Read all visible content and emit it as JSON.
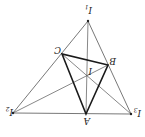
{
  "diagram": {
    "orientation": "rotated 180 degrees",
    "points": {
      "I1": {
        "label": "I",
        "sub": "1",
        "x": 88,
        "y": 21,
        "lx": 84,
        "ly": 10
      },
      "I2": {
        "label": "I",
        "sub": "2",
        "x": 13,
        "y": 113,
        "lx": 4,
        "ly": 106
      },
      "I3": {
        "label": "I",
        "sub": "3",
        "x": 131,
        "y": 114,
        "lx": 132,
        "ly": 107
      },
      "A": {
        "label": "A",
        "x": 86,
        "y": 114,
        "lx": 82,
        "ly": 116
      },
      "B": {
        "label": "B",
        "x": 108,
        "y": 65,
        "lx": 109,
        "ly": 57
      },
      "C": {
        "label": "C",
        "x": 62,
        "y": 54,
        "lx": 53,
        "ly": 46
      },
      "I": {
        "label": "I",
        "x": 87,
        "y": 76,
        "lx": 88,
        "ly": 68
      }
    },
    "stroke_color": "#444444",
    "bold_color": "#1a1a1a"
  }
}
